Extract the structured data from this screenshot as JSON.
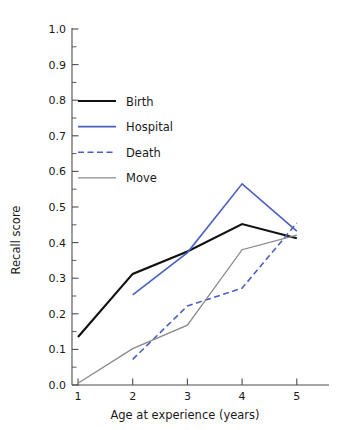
{
  "chart_data": {
    "type": "line",
    "title": "",
    "xlabel": "Age at experience (years)",
    "ylabel": "Recall score",
    "x": [
      1,
      2,
      3,
      4,
      5
    ],
    "xticklabels": [
      "1",
      "2",
      "3",
      "4",
      "5"
    ],
    "yticklabels": [
      "0.0",
      "0.1",
      "0.2",
      "0.3",
      "0.4",
      "0.5",
      "0.6",
      "0.7",
      "0.8",
      "0.9",
      "1.0"
    ],
    "xlim": [
      0.6,
      5.6
    ],
    "ylim": [
      0.0,
      1.0
    ],
    "grid": false,
    "legend_position": "upper left",
    "minor_ticks_y": true,
    "series": [
      {
        "name": "Birth",
        "color": "#111111",
        "style": "solid",
        "width": 2.1,
        "x": [
          1,
          2,
          3,
          4,
          5
        ],
        "values": [
          0.135,
          0.312,
          0.375,
          0.452,
          0.412
        ]
      },
      {
        "name": "Hospital",
        "color": "#4a5fc1",
        "style": "solid",
        "width": 1.6,
        "x": [
          2,
          3,
          4,
          5
        ],
        "values": [
          0.253,
          0.372,
          0.565,
          0.432
        ]
      },
      {
        "name": "Death",
        "color": "#4a5fc1",
        "style": "dashed",
        "width": 1.6,
        "x": [
          2,
          3,
          4,
          5
        ],
        "values": [
          0.072,
          0.222,
          0.272,
          0.455
        ]
      },
      {
        "name": "Move",
        "color": "#8a8a8a",
        "style": "solid",
        "width": 1.3,
        "x": [
          1,
          2,
          3,
          4,
          5
        ],
        "values": [
          0.005,
          0.102,
          0.168,
          0.38,
          0.421
        ]
      }
    ]
  },
  "axes": {
    "y_title": "Recall score",
    "x_title": "Age at experience (years)",
    "yticks": [
      "1.0",
      "0.9",
      "0.8",
      "0.7",
      "0.6",
      "0.5",
      "0.4",
      "0.3",
      "0.2",
      "0.1",
      "0.0"
    ],
    "xticks": [
      "1",
      "2",
      "3",
      "4",
      "5"
    ]
  },
  "legend": {
    "entries": [
      {
        "label": "Birth",
        "color": "#111111",
        "style": "solid",
        "width": 2.1
      },
      {
        "label": "Hospital",
        "color": "#4a5fc1",
        "style": "solid",
        "width": 1.6
      },
      {
        "label": "Death",
        "color": "#4a5fc1",
        "style": "dashed",
        "width": 1.6
      },
      {
        "label": "Move",
        "color": "#8a8a8a",
        "style": "solid",
        "width": 1.3
      }
    ]
  }
}
